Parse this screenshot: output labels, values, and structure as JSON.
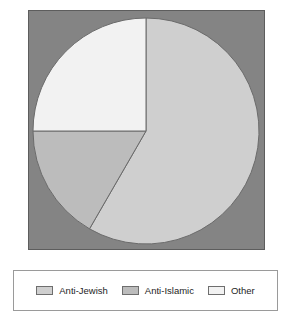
{
  "chart_data": {
    "type": "pie",
    "title": "",
    "categories": [
      "Anti-Jewish",
      "Anti-Islamic",
      "Other"
    ],
    "values": [
      58.3,
      16.7,
      25.0
    ],
    "units": "percent",
    "start_angle_deg": 0,
    "direction": "clockwise",
    "slice_angles_deg": [
      210,
      60,
      90
    ],
    "colors": [
      "#cfcfcf",
      "#bcbcbc",
      "#f2f2f2"
    ],
    "slice_border_color": "#6b6b6b",
    "legend_position": "bottom",
    "grid": false,
    "xlabel": "",
    "ylabel": ""
  },
  "plot": {
    "background_color": "#848484",
    "border_color": "#5d5d5d"
  },
  "legend": {
    "border_color": "#9a9a9a",
    "background_color": "#ffffff",
    "items": [
      {
        "label": "Anti-Jewish",
        "color": "#cfcfcf"
      },
      {
        "label": "Anti-Islamic",
        "color": "#bcbcbc"
      },
      {
        "label": "Other",
        "color": "#f2f2f2"
      }
    ]
  }
}
